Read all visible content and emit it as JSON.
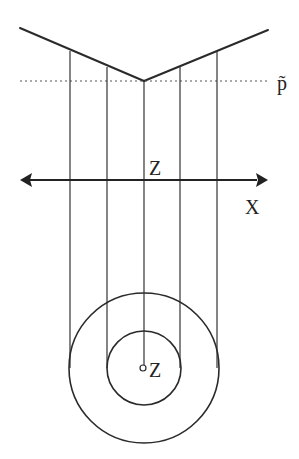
{
  "diagram": {
    "labels": {
      "p_tilde": "p̃",
      "axis_z": "Z",
      "axis_x": "X",
      "center_z": "Z"
    },
    "colors": {
      "stroke": "#2a2a2a",
      "background": "#ffffff"
    },
    "v_profile": {
      "left_end": [
        20,
        28
      ],
      "vertex": [
        144,
        81
      ],
      "right_end": [
        268,
        30
      ]
    },
    "dotted_line_y": 81,
    "axis_y": 180,
    "projection_x": [
      70,
      107,
      144,
      180,
      217
    ],
    "circles": {
      "center": [
        144,
        368
      ],
      "outer_r": 75,
      "inner_r": 37,
      "center_dot_r": 3
    }
  }
}
